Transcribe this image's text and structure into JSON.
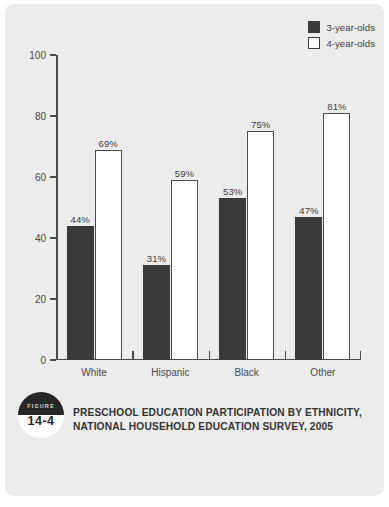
{
  "figure": {
    "badge_word": "FIGURE",
    "badge_number": "14-4",
    "caption_line1": "Preschool Education Participation by Ethnicity,",
    "caption_line2": "National Household Education Survey, 2005"
  },
  "legend": {
    "items": [
      {
        "label": "3-year-olds",
        "swatch": "dark-square-icon",
        "color": "#3a3a3a"
      },
      {
        "label": "4-year-olds",
        "swatch": "white-square-icon",
        "color": "#ffffff"
      }
    ]
  },
  "axis": {
    "y_ticks": [
      "0",
      "20",
      "40",
      "60",
      "80",
      "100"
    ],
    "x_categories": [
      "White",
      "Hispanic",
      "Black",
      "Other"
    ]
  },
  "chart_data": {
    "type": "bar",
    "title": "Preschool Education Participation by Ethnicity, National Household Education Survey, 2005",
    "xlabel": "",
    "ylabel": "",
    "ylim": [
      0,
      100
    ],
    "yticks": [
      0,
      20,
      40,
      60,
      80,
      100
    ],
    "grid": false,
    "legend_position": "top-right",
    "categories": [
      "White",
      "Hispanic",
      "Black",
      "Other"
    ],
    "series": [
      {
        "name": "3-year-olds",
        "color": "#3a3a3a",
        "values": [
          44,
          31,
          53,
          47
        ],
        "labels": [
          "44%",
          "31%",
          "53%",
          "47%"
        ]
      },
      {
        "name": "4-year-olds",
        "color": "#ffffff",
        "values": [
          69,
          59,
          75,
          81
        ],
        "labels": [
          "69%",
          "59%",
          "75%",
          "81%"
        ]
      }
    ]
  }
}
